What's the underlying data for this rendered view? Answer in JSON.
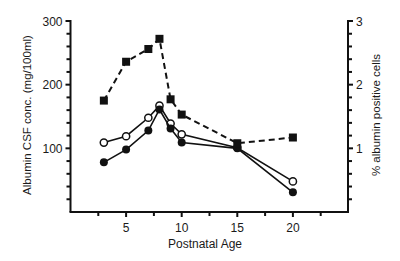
{
  "chart_data": {
    "type": "line",
    "title": "",
    "xlabel": "Postnatal Age",
    "ylabel": "Albumin CSF conc. (mg/100ml)",
    "y2label": "% albumin positive cells",
    "xlim": [
      0,
      25
    ],
    "ylim": [
      0,
      300
    ],
    "y2lim": [
      0,
      3
    ],
    "x_ticks": [
      5,
      10,
      15,
      20
    ],
    "x_minor_ticks": [
      2.5,
      7.5,
      12.5,
      17.5,
      22.5
    ],
    "y_ticks": [
      100,
      200,
      300
    ],
    "y_minor_step": 20,
    "y2_ticks": [
      1,
      2,
      3
    ],
    "y2_minor_step": 0.2,
    "grid": false,
    "legend": null,
    "series": [
      {
        "name": "Albumin CSF conc. (open circles)",
        "axis": "left",
        "marker": "open-circle",
        "line": "solid",
        "x": [
          3,
          5,
          7,
          8,
          9,
          10,
          15,
          20
        ],
        "values": [
          109,
          119,
          148,
          167,
          139,
          122,
          101,
          48
        ]
      },
      {
        "name": "Albumin CSF conc. (filled circles)",
        "axis": "left",
        "marker": "filled-circle",
        "line": "solid",
        "x": [
          3,
          5,
          7,
          8,
          9,
          10,
          15,
          20
        ],
        "values": [
          78,
          98,
          128,
          161,
          131,
          109,
          100,
          31
        ]
      },
      {
        "name": "% albumin positive cells",
        "axis": "right",
        "marker": "filled-square",
        "line": "dashed",
        "x": [
          3,
          5,
          7,
          8,
          9,
          10,
          15,
          20
        ],
        "values": [
          1.75,
          2.36,
          2.56,
          2.72,
          1.77,
          1.53,
          1.08,
          1.17
        ]
      }
    ]
  },
  "colors": {
    "ink": "#111111",
    "background": "#ffffff"
  }
}
